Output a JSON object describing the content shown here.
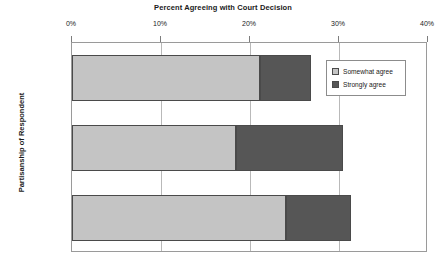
{
  "chart_data": {
    "type": "bar",
    "orientation": "horizontal",
    "stacked": true,
    "title": "Percent Agreeing with Court Decision",
    "xlabel": "",
    "ylabel": "Partisanship of Respondent",
    "categories": [
      "Democrats",
      "Republicans",
      "Independents"
    ],
    "series": [
      {
        "name": "Somewhat agree",
        "color": "#c4c4c4",
        "values": [
          21.1,
          18.4,
          24.0
        ]
      },
      {
        "name": "Strongly agree",
        "color": "#565656",
        "values": [
          5.7,
          12.0,
          7.3
        ]
      }
    ],
    "totals": [
      26.8,
      30.4,
      31.3
    ],
    "xlim": [
      0,
      40
    ],
    "xticks": [
      0,
      10,
      20,
      30,
      40
    ],
    "xtick_labels": [
      "0%",
      "10%",
      "20%",
      "30%",
      "40%"
    ],
    "grid": true,
    "grid_axis": "x",
    "legend_position": "top-right-inside",
    "axis_color": "#9a9a9a",
    "grid_color": "#b9b9b9",
    "bar_edge_color": "#4a4a4a",
    "background": "#ffffff"
  },
  "legend": {
    "items": [
      {
        "label": "Somewhat agree",
        "swatch": "#c4c4c4"
      },
      {
        "label": "Strongly agree",
        "swatch": "#565656"
      }
    ]
  }
}
